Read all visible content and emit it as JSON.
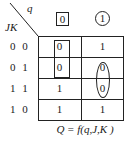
{
  "kmap": {
    "corner": {
      "col_var": "q",
      "row_var": "JK"
    },
    "col_headers": [
      {
        "label": "0",
        "marker": "box"
      },
      {
        "label": "1",
        "marker": "circle"
      }
    ],
    "row_headers": [
      "0 0",
      "0 1",
      "1 1",
      "1 0"
    ],
    "cells": [
      [
        "0",
        "1"
      ],
      [
        "0",
        "0"
      ],
      [
        "1",
        "0"
      ],
      [
        "1",
        "1"
      ]
    ],
    "groups": [
      {
        "shape": "rectangle",
        "column": "0",
        "rows": [
          "0 0",
          "0 1"
        ]
      },
      {
        "shape": "oval",
        "column": "1",
        "rows": [
          "0 1",
          "1 1"
        ]
      }
    ],
    "caption": "Q = f(q,J,K )"
  }
}
